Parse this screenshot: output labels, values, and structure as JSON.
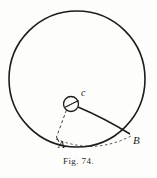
{
  "figure": {
    "caption": "Fig. 74.",
    "background_color": "#fdfdfb",
    "ink_color": "#1c1c1c",
    "labels": {
      "center": "c",
      "point_a": "A",
      "point_b": "B"
    }
  },
  "geometry": {
    "main_circle": {
      "name": "large-circle",
      "cx": 77,
      "cy": 79,
      "r": 68,
      "stroke": "#1c1c1c",
      "stroke_width": 1.6,
      "fill": "none"
    },
    "hub_circle": {
      "name": "center-hub-circle",
      "cx": 71,
      "cy": 104,
      "r": 7.5,
      "stroke": "#1c1c1c",
      "stroke_width": 1.3,
      "fill": "none"
    },
    "point_a": {
      "x": 56,
      "y": 139
    },
    "point_b": {
      "x": 131,
      "y": 136
    },
    "radius_line_ca": {
      "name": "dashed-radius-c-to-a",
      "dash": "3,2.5",
      "stroke_width": 0.9
    },
    "curve_cb": {
      "name": "solid-curve-c-to-b",
      "stroke_width": 1.5
    },
    "arc_ab": {
      "name": "dashed-arc-a-to-b",
      "dash": "2.5,2.5",
      "stroke_width": 0.8
    },
    "hub_spoke": {
      "name": "hub-spoke-line",
      "stroke_width": 1.1
    }
  }
}
